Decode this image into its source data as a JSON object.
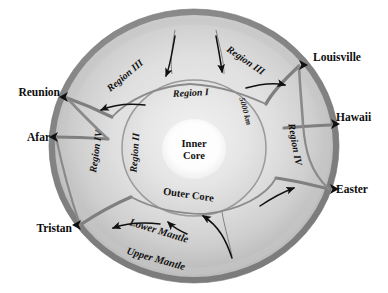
{
  "figure": {
    "colors": {
      "outer_ring": "#8f8f8f",
      "mantle_fill": "#d8d8d8",
      "outer_core_fill": "#e2e2e2",
      "inner_core_fill": "#ffffff",
      "divider": "#7a7a7a",
      "arrow": "#101010",
      "text": "#0d0d0d",
      "background": "#ffffff"
    }
  },
  "hotspots": [
    {
      "name": "Louisville",
      "id": "louisville"
    },
    {
      "name": "Hawaii",
      "id": "hawaii"
    },
    {
      "name": "Easter",
      "id": "easter"
    },
    {
      "name": "Tristan",
      "id": "tristan"
    },
    {
      "name": "Afar",
      "id": "afar"
    },
    {
      "name": "Reunion",
      "id": "reunion"
    }
  ],
  "regions": [
    {
      "label": "Region III",
      "id": "region-iii-left"
    },
    {
      "label": "Region III",
      "id": "region-iii-right"
    },
    {
      "label": "Region I",
      "id": "region-i"
    },
    {
      "label": "Region II",
      "id": "region-ii"
    },
    {
      "label": "Region IV",
      "id": "region-iv-left"
    },
    {
      "label": "Region IV",
      "id": "region-iv-right"
    }
  ],
  "core": {
    "inner_line1": "Inner",
    "inner_line2": "Core",
    "outer": "Outer Core"
  },
  "mantle": {
    "lower": "Lower Mantle",
    "upper": "Upper Mantle"
  },
  "scale": {
    "depth": "5000 km"
  }
}
